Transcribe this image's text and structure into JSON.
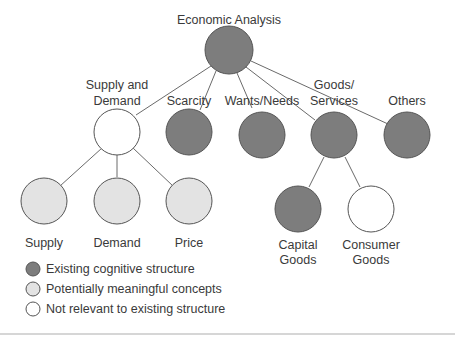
{
  "title": "Economic Analysis",
  "colors": {
    "existing": "#7d7d7d",
    "potential": "#e3e3e3",
    "not_relevant": "#ffffff",
    "stroke": "#555555",
    "edge": "#6a6a6a",
    "text": "#3a3a3a"
  },
  "nodes": {
    "root": {
      "label": "Economic Analysis",
      "type": "existing"
    },
    "supply_demand": {
      "label_line1": "Supply and",
      "label_line2": "Demand",
      "type": "not_relevant"
    },
    "scarcity": {
      "label": "Scarcity",
      "type": "existing"
    },
    "wants_needs": {
      "label": "Wants/Needs",
      "type": "existing"
    },
    "goods_services": {
      "label_line1": "Goods/",
      "label_line2": "Services",
      "type": "existing"
    },
    "others": {
      "label": "Others",
      "type": "existing"
    },
    "supply": {
      "label": "Supply",
      "type": "potential"
    },
    "demand": {
      "label": "Demand",
      "type": "potential"
    },
    "price": {
      "label": "Price",
      "type": "potential"
    },
    "capital_goods": {
      "label_line1": "Capital",
      "label_line2": "Goods",
      "type": "existing"
    },
    "consumer_goods": {
      "label_line1": "Consumer",
      "label_line2": "Goods",
      "type": "not_relevant"
    }
  },
  "edges": [
    [
      "root",
      "supply_demand"
    ],
    [
      "root",
      "scarcity"
    ],
    [
      "root",
      "wants_needs"
    ],
    [
      "root",
      "goods_services"
    ],
    [
      "root",
      "others"
    ],
    [
      "supply_demand",
      "supply"
    ],
    [
      "supply_demand",
      "demand"
    ],
    [
      "supply_demand",
      "price"
    ],
    [
      "goods_services",
      "capital_goods"
    ],
    [
      "goods_services",
      "consumer_goods"
    ]
  ],
  "legend": {
    "items": [
      {
        "label": "Existing cognitive structure",
        "type": "existing"
      },
      {
        "label": "Potentially meaningful concepts",
        "type": "potential"
      },
      {
        "label": "Not relevant to existing structure",
        "type": "not_relevant"
      }
    ]
  }
}
